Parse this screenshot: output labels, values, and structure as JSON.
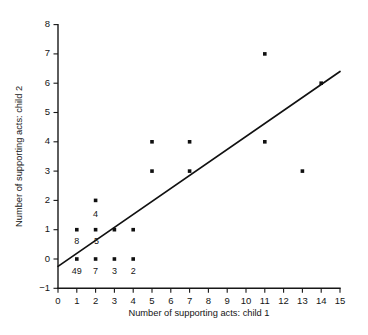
{
  "chart_data": {
    "type": "scatter",
    "title": "",
    "xlabel": "Number of supporting acts: child 1",
    "ylabel": "Number of supporting acts: child 2",
    "xlim": [
      0,
      15
    ],
    "ylim": [
      -1,
      8
    ],
    "xticks": [
      "0",
      "1",
      "2",
      "3",
      "4",
      "5",
      "6",
      "7",
      "8",
      "9",
      "10",
      "11",
      "12",
      "13",
      "14",
      "15"
    ],
    "yticks": [
      "-1",
      "0",
      "1",
      "2",
      "3",
      "4",
      "5",
      "6",
      "7",
      "8"
    ],
    "grid": false,
    "legend": false,
    "marker_color": "#101010",
    "line_color": "#111111",
    "points": [
      {
        "x": 1,
        "y": 1
      },
      {
        "x": 1,
        "y": 0
      },
      {
        "x": 2,
        "y": 2
      },
      {
        "x": 2,
        "y": 1
      },
      {
        "x": 2,
        "y": 0
      },
      {
        "x": 3,
        "y": 1
      },
      {
        "x": 3,
        "y": 0
      },
      {
        "x": 4,
        "y": 1
      },
      {
        "x": 4,
        "y": 0
      },
      {
        "x": 5,
        "y": 4
      },
      {
        "x": 5,
        "y": 3
      },
      {
        "x": 7,
        "y": 4
      },
      {
        "x": 7,
        "y": 3
      },
      {
        "x": 11,
        "y": 7
      },
      {
        "x": 11,
        "y": 4
      },
      {
        "x": 13,
        "y": 3
      },
      {
        "x": 14,
        "y": 6
      }
    ],
    "point_annotations": [
      {
        "label": "8",
        "x": 1,
        "y": 0.58
      },
      {
        "label": "4",
        "x": 2,
        "y": 1.52
      },
      {
        "label": "5",
        "x": 2.05,
        "y": 0.58
      },
      {
        "label": "49",
        "x": 1,
        "y": -0.42
      },
      {
        "label": "7",
        "x": 2,
        "y": -0.42
      },
      {
        "label": "3",
        "x": 3,
        "y": -0.42
      },
      {
        "label": "2",
        "x": 4,
        "y": -0.42
      }
    ],
    "fit_line": {
      "label": "regression-line",
      "x0": 0,
      "y0": -0.25,
      "x1": 15,
      "y1": 6.4
    }
  }
}
